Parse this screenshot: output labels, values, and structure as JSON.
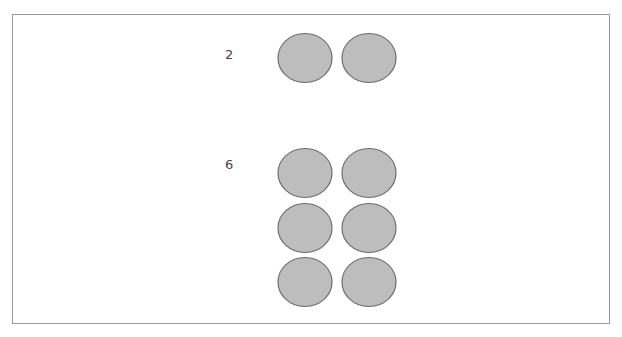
{
  "groups": [
    {
      "label": "2",
      "count": 2,
      "label_pos": {
        "x": 225,
        "y": 48
      },
      "dots": [
        {
          "cx": 305,
          "cy": 58
        },
        {
          "cx": 369,
          "cy": 58
        }
      ]
    },
    {
      "label": "6",
      "count": 6,
      "label_pos": {
        "x": 225,
        "y": 158
      },
      "dots": [
        {
          "cx": 305,
          "cy": 173
        },
        {
          "cx": 369,
          "cy": 173
        },
        {
          "cx": 305,
          "cy": 228
        },
        {
          "cx": 369,
          "cy": 228
        },
        {
          "cx": 305,
          "cy": 282
        },
        {
          "cx": 369,
          "cy": 282
        }
      ]
    }
  ],
  "dot_style": {
    "rx": 27,
    "ry": 24.5,
    "fill": "#bdbdbd",
    "stroke": "#6e6e6e"
  }
}
